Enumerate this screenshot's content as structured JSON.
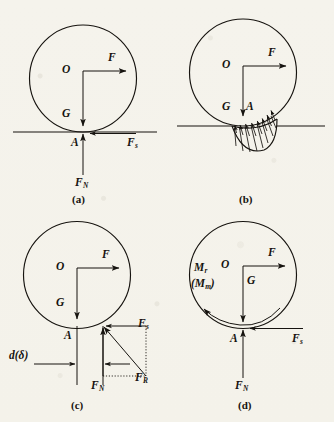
{
  "figure": {
    "background_color": "#f5f3ec",
    "ink_color": "#16130f",
    "panel_count": 4
  },
  "panels": [
    {
      "id": "a",
      "caption": "(a)",
      "description": "Rigid wheel on rigid ground: ideal point contact at A",
      "labels": {
        "center": "O",
        "applied_force": "F",
        "weight": "G",
        "contact_point": "A",
        "friction_force": "F",
        "friction_sub": "s",
        "normal_force": "F",
        "normal_sub": "N"
      }
    },
    {
      "id": "b",
      "caption": "(b)",
      "description": "Deformable ground: distributed normal pressure over the contact patch",
      "labels": {
        "center": "O",
        "applied_force": "F",
        "weight": "G",
        "contact_point": "A"
      },
      "pressure_arrow_count": 9
    },
    {
      "id": "c",
      "caption": "(c)",
      "description": "Resultant reaction force offset by distance d (delta) ahead of A",
      "labels": {
        "center": "O",
        "applied_force": "F",
        "weight": "G",
        "contact_point": "A",
        "friction_force": "F",
        "friction_sub": "s",
        "normal_force": "F",
        "normal_sub": "N",
        "resultant_force": "F",
        "resultant_sub": "R",
        "offset_distance": "d(δ)"
      }
    },
    {
      "id": "d",
      "caption": "(d)",
      "description": "Equivalent rolling resistance moment at the contact point",
      "labels": {
        "center": "O",
        "applied_force": "F",
        "weight": "G",
        "contact_point": "A",
        "friction_force": "F",
        "friction_sub": "s",
        "normal_force": "F",
        "normal_sub": "N",
        "rolling_moment": "M",
        "rolling_moment_sub": "r",
        "max_moment_open": "(M",
        "max_moment_sub": "m",
        "max_moment_close": ")"
      }
    }
  ]
}
